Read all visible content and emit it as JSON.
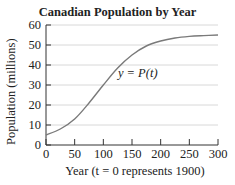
{
  "chart_data": {
    "type": "line",
    "title": "Canadian Population by Year",
    "xlabel": "Year (t = 0 represents 1900)",
    "ylabel": "Population (millions)",
    "xlim": [
      0,
      300
    ],
    "ylim": [
      0,
      60
    ],
    "x_ticks": [
      0,
      50,
      100,
      150,
      200,
      250,
      300
    ],
    "y_ticks": [
      0,
      10,
      20,
      30,
      40,
      50,
      60
    ],
    "grid": "horizontal",
    "annotation": "y = P(t)",
    "series": [
      {
        "name": "P(t)",
        "x": [
          0,
          25,
          50,
          75,
          100,
          125,
          150,
          175,
          200,
          225,
          250,
          275,
          300
        ],
        "values": [
          5,
          8,
          13,
          21,
          30,
          38.5,
          45,
          49.5,
          52,
          53.5,
          54.3,
          54.7,
          55
        ]
      }
    ],
    "colors": {
      "line": "#7a7a7a",
      "grid": "#d8d8d8",
      "axis": "#333333"
    }
  }
}
